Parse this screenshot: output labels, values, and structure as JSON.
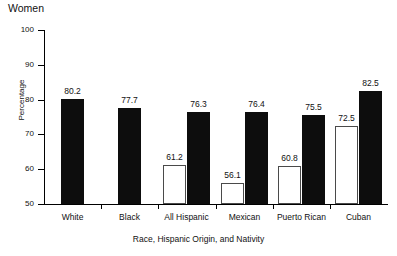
{
  "chart_data": {
    "type": "bar",
    "title": "Women",
    "xlabel": "Race, Hispanic Origin, and Nativity",
    "ylabel": "Percentage",
    "ylim": [
      50,
      100
    ],
    "yticks": [
      50,
      60,
      70,
      80,
      90,
      100
    ],
    "grid": false,
    "legend": "none",
    "categories": [
      "White",
      "Black",
      "All Hispanic",
      "Mexican",
      "Puerto Rican",
      "Cuban"
    ],
    "series": [
      {
        "name": "open-bar",
        "style": "hollow",
        "values": [
          null,
          null,
          61.2,
          56.1,
          60.8,
          72.5
        ]
      },
      {
        "name": "filled-bar",
        "style": "solid",
        "values": [
          80.2,
          77.7,
          76.3,
          76.4,
          75.5,
          82.5
        ]
      }
    ],
    "value_labels": {
      "White": [
        "80.2"
      ],
      "Black": [
        "77.7"
      ],
      "All Hispanic": [
        "61.2",
        "76.3"
      ],
      "Mexican": [
        "56.1",
        "76.4"
      ],
      "Puerto Rican": [
        "60.8",
        "75.5"
      ],
      "Cuban": [
        "72.5",
        "82.5"
      ]
    }
  },
  "axis": {
    "y_tick_labels": [
      "100",
      "90",
      "80",
      "70",
      "60",
      "50"
    ]
  }
}
